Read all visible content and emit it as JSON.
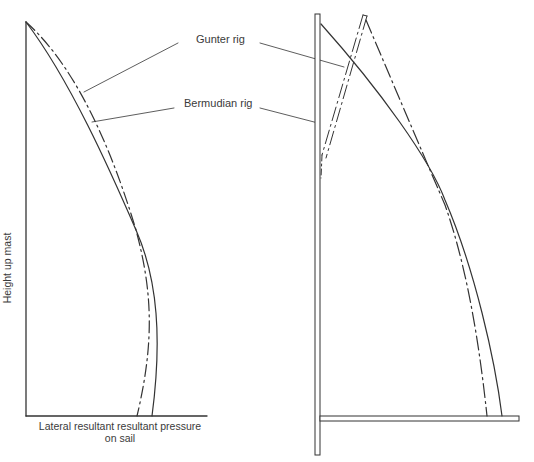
{
  "diagram": {
    "labels": {
      "gunter": "Gunter rig",
      "bermudian": "Bermudian rig"
    },
    "left_plot": {
      "ylabel": "Height up mast",
      "xlabel_line1": "Lateral resultant resultant pressure",
      "xlabel_line2": "on sail"
    },
    "legend_styles": {
      "gunter": "dash-dot",
      "bermudian": "solid"
    },
    "colors": {
      "line": "#333333",
      "background": "#ffffff"
    }
  }
}
